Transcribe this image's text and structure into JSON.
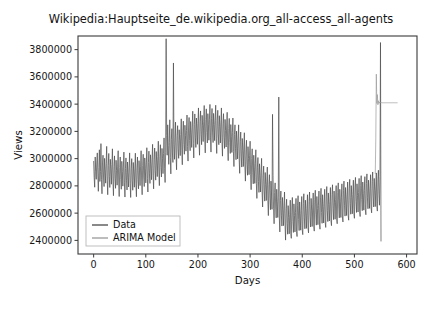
{
  "figure": {
    "background_color": "#ffffff",
    "cut_off_top_text": "",
    "axes_frame_color": "#3a3a3a"
  },
  "chart_data": {
    "type": "line",
    "title": "Wikipedia:Hauptseite_de.wikipedia.org_all-access_all-agents",
    "xlabel": "Days",
    "ylabel": "Views",
    "xlim": [
      -30,
      620
    ],
    "ylim": [
      2300000,
      3900000
    ],
    "xticks": [
      0,
      100,
      200,
      300,
      400,
      500,
      600
    ],
    "xtick_labels": [
      "0",
      "100",
      "200",
      "300",
      "400",
      "500",
      "600"
    ],
    "yticks": [
      2400000,
      2600000,
      2800000,
      3000000,
      3200000,
      3400000,
      3600000,
      3800000
    ],
    "ytick_labels": [
      "2400000",
      "2600000",
      "2800000",
      "3000000",
      "3200000",
      "3400000",
      "3600000",
      "3800000"
    ],
    "grid": false,
    "legend_position": "lower left",
    "series": [
      {
        "name": "Data",
        "color": "#4a4a4a",
        "linewidth": 0.7,
        "x_start": 0,
        "x_end": 548,
        "x_step": 1,
        "values": [
          2980000,
          2862000,
          2790000,
          3012000,
          2905000,
          2848000,
          2975000,
          3042000,
          2880000,
          2760000,
          2935000,
          3065000,
          2832000,
          2905000,
          3110000,
          2848000,
          2742000,
          2968000,
          3025000,
          2858000,
          2795000,
          3002000,
          2918000,
          2820000,
          2965000,
          3090000,
          2842000,
          2735000,
          2950000,
          3038000,
          2868000,
          2788000,
          2995000,
          2925000,
          2812000,
          2958000,
          3072000,
          2835000,
          2728000,
          2942000,
          3020000,
          2855000,
          2782000,
          2988000,
          2912000,
          2805000,
          2945000,
          3058000,
          2828000,
          2722000,
          2935000,
          3012000,
          2848000,
          2775000,
          2980000,
          2905000,
          2798000,
          2938000,
          3048000,
          2822000,
          2718000,
          2928000,
          3005000,
          2842000,
          2770000,
          2975000,
          2898000,
          2792000,
          2932000,
          3042000,
          2818000,
          2715000,
          2925000,
          3000000,
          2838000,
          2768000,
          2972000,
          2895000,
          2790000,
          2930000,
          3040000,
          2820000,
          2720000,
          2932000,
          3012000,
          2848000,
          2778000,
          2985000,
          2910000,
          2802000,
          2945000,
          3058000,
          2835000,
          2735000,
          2950000,
          3032000,
          2865000,
          2795000,
          3005000,
          2930000,
          2822000,
          2968000,
          3080000,
          2855000,
          2755000,
          2972000,
          3055000,
          2888000,
          2818000,
          3028000,
          2952000,
          2845000,
          2992000,
          3105000,
          2878000,
          2778000,
          2995000,
          3078000,
          2912000,
          2842000,
          3052000,
          2975000,
          2868000,
          3015000,
          3128000,
          2902000,
          2802000,
          3018000,
          3102000,
          2935000,
          2865000,
          3075000,
          3000000,
          2890000,
          3038000,
          3152000,
          2925000,
          2825000,
          3042000,
          3880000,
          3168000,
          3025000,
          3248000,
          3095000,
          2958000,
          3118000,
          3285000,
          3008000,
          2888000,
          3142000,
          3220000,
          3048000,
          2972000,
          3702000,
          3105000,
          2995000,
          3152000,
          3268000,
          3025000,
          2918000,
          3168000,
          3242000,
          3072000,
          3002000,
          3212000,
          3135000,
          3022000,
          3178000,
          3292000,
          3062000,
          2955000,
          3198000,
          3275000,
          3105000,
          3032000,
          3245000,
          3168000,
          3055000,
          3205000,
          3320000,
          3088000,
          2982000,
          3225000,
          3302000,
          3132000,
          3058000,
          3272000,
          3195000,
          3082000,
          3232000,
          3348000,
          3112000,
          3005000,
          3252000,
          3328000,
          3158000,
          3082000,
          3298000,
          3218000,
          3105000,
          3255000,
          3372000,
          3135000,
          3025000,
          3272000,
          3350000,
          3178000,
          3102000,
          3318000,
          3240000,
          3125000,
          3275000,
          3390000,
          3152000,
          3042000,
          3288000,
          3365000,
          3192000,
          3115000,
          3330000,
          3252000,
          3135000,
          3285000,
          3398000,
          3158000,
          3048000,
          3292000,
          3368000,
          3195000,
          3118000,
          3332000,
          3252000,
          3132000,
          3280000,
          3392000,
          3150000,
          3038000,
          3282000,
          3355000,
          3182000,
          3102000,
          3315000,
          3235000,
          3115000,
          3262000,
          3372000,
          3128000,
          3018000,
          3258000,
          3330000,
          3155000,
          3075000,
          3288000,
          3205000,
          3085000,
          3232000,
          3340000,
          3095000,
          2985000,
          3222000,
          3295000,
          3118000,
          3038000,
          3250000,
          3165000,
          3045000,
          3192000,
          3298000,
          3052000,
          2942000,
          3178000,
          3248000,
          3072000,
          2992000,
          3202000,
          3118000,
          2998000,
          3142000,
          3248000,
          3002000,
          2892000,
          3125000,
          3195000,
          3018000,
          2938000,
          3148000,
          3062000,
          2942000,
          3085000,
          3190000,
          2945000,
          2835000,
          3065000,
          3135000,
          2958000,
          2878000,
          3088000,
          3002000,
          2882000,
          3025000,
          3128000,
          2882000,
          2772000,
          3002000,
          3072000,
          2895000,
          2815000,
          3025000,
          2938000,
          2818000,
          2962000,
          3065000,
          2818000,
          2708000,
          2938000,
          3008000,
          2832000,
          2752000,
          2962000,
          2875000,
          2755000,
          2898000,
          3002000,
          2755000,
          2645000,
          2875000,
          2945000,
          2768000,
          2688000,
          2898000,
          2812000,
          2692000,
          2835000,
          2938000,
          2692000,
          2582000,
          2812000,
          2882000,
          2705000,
          2625000,
          2835000,
          2748000,
          2628000,
          3325000,
          2875000,
          2632000,
          2522000,
          2752000,
          2822000,
          2645000,
          2565000,
          2775000,
          2688000,
          2568000,
          2712000,
          3452000,
          2572000,
          2462000,
          2692000,
          2762000,
          2585000,
          2505000,
          2715000,
          2628000,
          2508000,
          2652000,
          2755000,
          2512000,
          2402000,
          2632000,
          2702000,
          2525000,
          2445000,
          2655000,
          2568000,
          2448000,
          2592000,
          2695000,
          2452000,
          2415000,
          2645000,
          2715000,
          2538000,
          2458000,
          2668000,
          2582000,
          2462000,
          2605000,
          2708000,
          2465000,
          2428000,
          2658000,
          2728000,
          2552000,
          2472000,
          2682000,
          2595000,
          2475000,
          2618000,
          2722000,
          2478000,
          2442000,
          2672000,
          2742000,
          2565000,
          2485000,
          2695000,
          2608000,
          2488000,
          2632000,
          2735000,
          2492000,
          2455000,
          2685000,
          2755000,
          2578000,
          2498000,
          2708000,
          2622000,
          2502000,
          2645000,
          2748000,
          2505000,
          2468000,
          2698000,
          2768000,
          2592000,
          2512000,
          2722000,
          2635000,
          2515000,
          2658000,
          2762000,
          2518000,
          2482000,
          2712000,
          2782000,
          2605000,
          2525000,
          2735000,
          2648000,
          2528000,
          2672000,
          2775000,
          2532000,
          2495000,
          2725000,
          2795000,
          2618000,
          2538000,
          2748000,
          2662000,
          2542000,
          2685000,
          2788000,
          2545000,
          2508000,
          2738000,
          2808000,
          2632000,
          2552000,
          2762000,
          2675000,
          2555000,
          2698000,
          2802000,
          2558000,
          2522000,
          2752000,
          2822000,
          2645000,
          2565000,
          2775000,
          2688000,
          2568000,
          2712000,
          2815000,
          2572000,
          2535000,
          2765000,
          2835000,
          2658000,
          2578000,
          2788000,
          2702000,
          2582000,
          2725000,
          2828000,
          2585000,
          2548000,
          2778000,
          2848000,
          2672000,
          2592000,
          2802000,
          2715000,
          2595000,
          2738000,
          2842000,
          2598000,
          2562000,
          2792000,
          2862000,
          2685000,
          2605000,
          2815000,
          2728000,
          2608000,
          2752000,
          2855000,
          2612000,
          2575000,
          2805000,
          2875000,
          2698000,
          2618000,
          2828000,
          2742000,
          2622000,
          2765000,
          2868000,
          2625000,
          2588000,
          2818000,
          2888000,
          2712000,
          2632000,
          2842000,
          2755000,
          2635000,
          2778000,
          2882000,
          2638000,
          2602000,
          2832000,
          2902000,
          2725000,
          2645000,
          2855000,
          2768000,
          2648000,
          2792000,
          2895000,
          2652000,
          2615000,
          2845000,
          2915000,
          2738000,
          2658000,
          2868000,
          3852000,
          2395000
        ]
      },
      {
        "name": "ARIMA Model",
        "color": "#9a9a9a",
        "linewidth": 0.7,
        "x_start": 540,
        "x_end": 582,
        "x_step": 1,
        "values": [
          2890000,
          3150000,
          3620000,
          3405000,
          3470000,
          3395000,
          3425000,
          3405000,
          3415000,
          3408000,
          3412000,
          3409000,
          3411000,
          3410000,
          3410000,
          3410000,
          3410000,
          3410000,
          3410000,
          3410000,
          3410000,
          3410000,
          3410000,
          3410000,
          3410000,
          3410000,
          3410000,
          3410000,
          3410000,
          3410000,
          3410000,
          3410000,
          3410000,
          3410000,
          3410000,
          3410000,
          3410000,
          3410000,
          3410000,
          3410000,
          3410000,
          3410000,
          3410000
        ]
      }
    ],
    "legend_entries": [
      {
        "label": "Data",
        "color": "#4a4a4a"
      },
      {
        "label": "ARIMA Model",
        "color": "#9a9a9a"
      }
    ]
  }
}
